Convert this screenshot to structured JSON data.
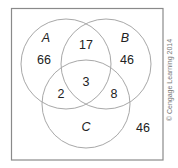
{
  "diagram": {
    "type": "venn",
    "sets": [
      {
        "label": "A",
        "color": "#a8a8a8"
      },
      {
        "label": "B",
        "color": "#a8a8a8"
      },
      {
        "label": "C",
        "color": "#a8a8a8"
      }
    ],
    "regions": {
      "a_only": "66",
      "b_only": "46",
      "c_only": "",
      "a_and_b_only": "17",
      "a_and_c_only": "2",
      "b_and_c_only": "8",
      "a_and_b_and_c": "3",
      "outside": "46"
    },
    "credit": "© Cengage Learning 2014"
  }
}
